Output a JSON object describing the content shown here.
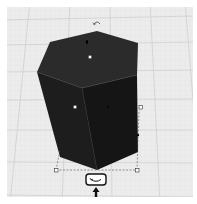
{
  "workspace": {
    "type": "3d-workplane",
    "grid_color": "#d4d4d4",
    "grid_minor_color": "#e2e2e2",
    "background": "#eeeeee"
  },
  "shape": {
    "name": "hexagonal-prism",
    "top_face_color": "#2a2a2a",
    "front_left_color": "#1c1c1c",
    "front_right_color": "#161616",
    "edge_color": "#3a3a3a"
  },
  "handles": {
    "color": "#ffffff",
    "stroke": "#333333",
    "bounding_box_dash": "#555555"
  },
  "controls": {
    "rotate_top_icon": "rotate-arrow-icon",
    "rotate_bottom_icon": "rotate-arrow-icon",
    "move_up_icon": "arrow-up-icon"
  }
}
